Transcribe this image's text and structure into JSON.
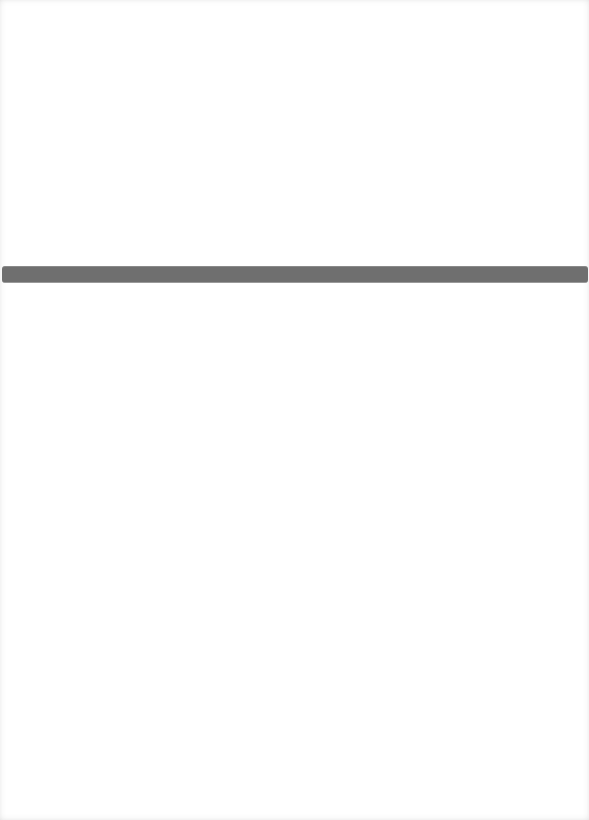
{
  "page": {
    "background_color": "#ffffff",
    "text_content": []
  },
  "divider": {
    "color": "#6f6f6f",
    "top_px": 266,
    "height_px": 17
  }
}
